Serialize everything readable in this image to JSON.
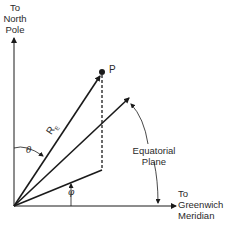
{
  "diagram": {
    "labels": {
      "north_pole": [
        "To",
        "North",
        "Pole"
      ],
      "point": "P",
      "radius": "R",
      "radius_sub": "E",
      "theta": "θ",
      "phi": "φ",
      "equatorial_plane": [
        "Equatorial",
        "Plane"
      ],
      "greenwich": [
        "To",
        "Greenwich",
        "Meridian"
      ]
    },
    "colors": {
      "line": "#1a1a1a",
      "text": "#2a2a2a",
      "background": "#ffffff"
    }
  }
}
